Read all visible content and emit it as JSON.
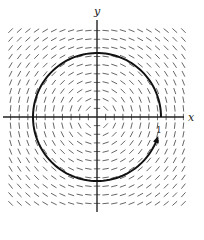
{
  "figure": {
    "type": "direction-field",
    "field_description": "slope field tangent to concentric circles centered at the origin, F(x,y) = (-y, x)",
    "field": {
      "fx": "-y",
      "fy": "x"
    },
    "grid": {
      "columns": 21,
      "rows": 21,
      "range": [
        -1.35,
        1.35
      ]
    },
    "axes": {
      "x_label": "x",
      "y_label": "y",
      "x_range": [
        -1.5,
        1.35
      ],
      "y_range": [
        -1.5,
        1.15
      ]
    },
    "curve": {
      "type": "circle",
      "center": [
        0,
        0
      ],
      "radius": 1,
      "start_angle_deg": 0,
      "end_angle_deg": 341,
      "direction": "counterclockwise",
      "arrow_at_end": true
    },
    "annotations": [
      {
        "text": "1",
        "x": 0.95,
        "y": -0.17
      }
    ],
    "colors": {
      "field": "#555555",
      "axes": "#222222",
      "curve": "#111111"
    }
  }
}
